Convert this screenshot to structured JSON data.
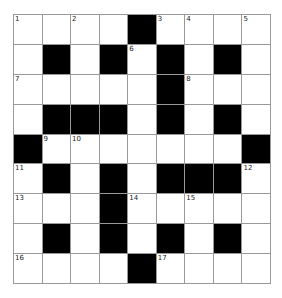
{
  "puzzle": {
    "rows": 9,
    "cols": 9,
    "colors": {
      "block": "#000000",
      "cell": "#ffffff",
      "line": "#999999"
    },
    "grid": [
      "....#....",
      ".#.#.#.#.",
      ".....#...",
      ".###.#.#.",
      "#.......#",
      ".#.#.###.",
      "...#.....",
      ".#.#.#.#.",
      "....#...."
    ],
    "numbers": [
      {
        "row": 0,
        "col": 0,
        "n": "1"
      },
      {
        "row": 0,
        "col": 2,
        "n": "2"
      },
      {
        "row": 0,
        "col": 5,
        "n": "3"
      },
      {
        "row": 0,
        "col": 6,
        "n": "4"
      },
      {
        "row": 0,
        "col": 8,
        "n": "5"
      },
      {
        "row": 1,
        "col": 4,
        "n": "6"
      },
      {
        "row": 2,
        "col": 0,
        "n": "7"
      },
      {
        "row": 2,
        "col": 6,
        "n": "8"
      },
      {
        "row": 4,
        "col": 1,
        "n": "9"
      },
      {
        "row": 4,
        "col": 2,
        "n": "10"
      },
      {
        "row": 5,
        "col": 0,
        "n": "11"
      },
      {
        "row": 5,
        "col": 8,
        "n": "12"
      },
      {
        "row": 6,
        "col": 0,
        "n": "13"
      },
      {
        "row": 6,
        "col": 4,
        "n": "14"
      },
      {
        "row": 6,
        "col": 6,
        "n": "15"
      },
      {
        "row": 8,
        "col": 0,
        "n": "16"
      },
      {
        "row": 8,
        "col": 5,
        "n": "17"
      }
    ]
  }
}
